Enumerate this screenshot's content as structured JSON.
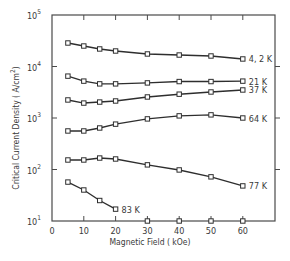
{
  "chart_data": {
    "type": "line",
    "title": "",
    "xlabel": "Magnetic Field ( kOe)",
    "ylabel": "Critical Current Density ( A/cm²)",
    "ylabel_base": "Critical Current Density ( A/cm",
    "ylabel_sup": "2",
    "ylabel_close": ")",
    "xlim": [
      0,
      70
    ],
    "ylim": [
      10,
      100000
    ],
    "yscale": "log",
    "grid": false,
    "legend": "inline labels at line ends",
    "x_ticks": [
      0,
      10,
      20,
      30,
      40,
      50,
      60
    ],
    "x_tick_labels": [
      "0",
      "10",
      "20",
      "30",
      "40",
      "50",
      "60"
    ],
    "y_ticks": [
      {
        "base": "10",
        "exp": "1",
        "value": 10
      },
      {
        "base": "10",
        "exp": "2",
        "value": 100
      },
      {
        "base": "10",
        "exp": "3",
        "value": 1000
      },
      {
        "base": "10",
        "exp": "4",
        "value": 10000
      },
      {
        "base": "10",
        "exp": "5",
        "value": 100000
      }
    ],
    "series": [
      {
        "name": "4, 2 K",
        "x": [
          5,
          10,
          15,
          20,
          30,
          40,
          50,
          60
        ],
        "values": [
          28600,
          25000,
          21900,
          20000,
          17500,
          16700,
          16000,
          14000
        ]
      },
      {
        "name": "21 K",
        "x": [
          5,
          10,
          15,
          20,
          30,
          40,
          50,
          60
        ],
        "values": [
          6500,
          5200,
          4600,
          4600,
          4800,
          5100,
          5100,
          5200
        ]
      },
      {
        "name": "37 K",
        "x": [
          5,
          10,
          15,
          20,
          30,
          40,
          50,
          60
        ],
        "values": [
          2240,
          1950,
          2040,
          2140,
          2560,
          2900,
          3200,
          3500
        ]
      },
      {
        "name": "64 K",
        "x": [
          5,
          10,
          15,
          20,
          30,
          40,
          50,
          60
        ],
        "values": [
          560,
          560,
          640,
          760,
          960,
          1100,
          1150,
          1000
        ]
      },
      {
        "name": "77 K",
        "x": [
          5,
          10,
          15,
          20,
          30,
          40,
          50,
          60
        ],
        "values": [
          153,
          153,
          167,
          160,
          123,
          98,
          72,
          48
        ]
      },
      {
        "name": "83 K",
        "x": [
          5,
          10,
          15,
          20
        ],
        "values": [
          57,
          40,
          25,
          17
        ]
      }
    ],
    "baseline_markers": {
      "x": [
        30,
        40,
        50,
        60
      ],
      "value": 10,
      "note": "open markers drawn on x-axis"
    }
  }
}
